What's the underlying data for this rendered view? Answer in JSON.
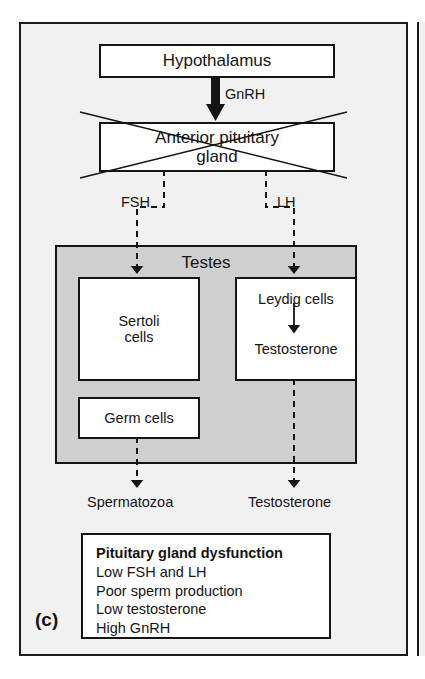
{
  "panel": {
    "letter": "(c)",
    "background_color": "#f1f1f1",
    "border_color": "#1c1c1c"
  },
  "diagram": {
    "title_boxes": {
      "hypothalamus": "Hypothalamus",
      "anterior_pituitary": "Anterior pituitary\ngland",
      "anterior_pituitary_line1": "Anterior pituitary",
      "anterior_pituitary_line2": "gland",
      "testes": "Testes",
      "sertoli_line1": "Sertoli",
      "sertoli_line2": "cells",
      "leydig": "Leydig cells",
      "testosterone_inner": "Testosterone",
      "germ_cells": "Germ cells"
    },
    "hormone_labels": {
      "gnrh": "GnRH",
      "fsh": "FSH",
      "lh": "LH"
    },
    "outputs": {
      "spermatozoa": "Spermatozoa",
      "testosterone": "Testosterone"
    },
    "crossed_out_box": "anterior_pituitary",
    "testes_fill_color": "#cfcfcf",
    "box_fill_color": "#ffffff",
    "stroke_color": "#141414"
  },
  "summary": {
    "title": "Pituitary gland dysfunction",
    "lines": [
      "Low FSH and LH",
      "Poor sperm production",
      "Low testosterone",
      "High GnRH"
    ],
    "line_1": "Low FSH and LH",
    "line_2": "Poor sperm production",
    "line_3": "Low testosterone",
    "line_4": "High GnRH"
  }
}
